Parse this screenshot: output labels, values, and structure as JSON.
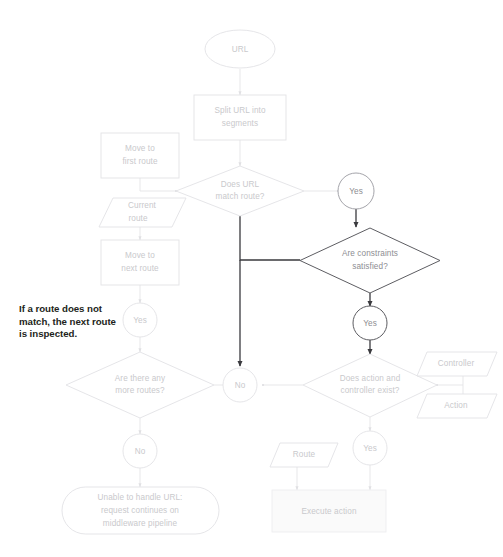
{
  "diagram": {
    "colors": {
      "background": "#ffffff",
      "light_stroke": "#e2e2e5",
      "light_text": "#c9c9cc",
      "emphasis_stroke": "#3a3a3e",
      "emphasis_text": "#8d8d92",
      "annotation_text": "#231f20",
      "filled_shape": "#fafafa"
    },
    "nodes": {
      "url_start": {
        "label": "URL",
        "shape": "ellipse"
      },
      "split_url": {
        "label": "Split URL into\nsegments",
        "shape": "process"
      },
      "move_first_route": {
        "label": "Move to\nfirst route",
        "shape": "process"
      },
      "does_url_match": {
        "label": "Does URL\nmatch route?",
        "shape": "decision"
      },
      "current_route": {
        "label": "Current\nroute",
        "shape": "data"
      },
      "move_next_route": {
        "label": "Move to\nnext route",
        "shape": "process"
      },
      "yes_match": {
        "label": "Yes",
        "shape": "connector"
      },
      "yes_loop": {
        "label": "Yes",
        "shape": "connector"
      },
      "are_constraints": {
        "label": "Are constraints\nsatisfied?",
        "shape": "decision"
      },
      "yes_constraints": {
        "label": "Yes",
        "shape": "connector"
      },
      "are_more_routes": {
        "label": "Are there any\nmore routes?",
        "shape": "decision"
      },
      "no_center": {
        "label": "No",
        "shape": "connector"
      },
      "no_more_routes": {
        "label": "No",
        "shape": "connector"
      },
      "does_action": {
        "label": "Does action and\ncontroller exist?",
        "shape": "decision"
      },
      "controller": {
        "label": "Controller",
        "shape": "data"
      },
      "action": {
        "label": "Action",
        "shape": "data"
      },
      "route_data": {
        "label": "Route",
        "shape": "data"
      },
      "yes_action": {
        "label": "Yes",
        "shape": "connector"
      },
      "execute_action": {
        "label": "Execute action",
        "shape": "process"
      },
      "unable_handle": {
        "label": "Unable to handle URL:\nrequest continues on\nmiddleware pipeline",
        "shape": "terminator"
      }
    },
    "node_lines": {
      "split_url": [
        "Split URL into",
        "segments"
      ],
      "move_first_route": [
        "Move to",
        "first route"
      ],
      "does_url_match": [
        "Does URL",
        "match route?"
      ],
      "current_route": [
        "Current",
        "route"
      ],
      "move_next_route": [
        "Move to",
        "next route"
      ],
      "are_constraints": [
        "Are constraints",
        "satisfied?"
      ],
      "are_more_routes": [
        "Are there any",
        "more routes?"
      ],
      "does_action": [
        "Does action and",
        "controller exist?"
      ],
      "unable_handle": [
        "Unable to handle URL:",
        "request continues on",
        "middleware pipeline"
      ]
    },
    "annotation": {
      "text": "If a route does not\nmatch, the next route\nis inspected.",
      "lines": [
        "If a route does not",
        "match, the next route",
        "is inspected."
      ]
    }
  }
}
